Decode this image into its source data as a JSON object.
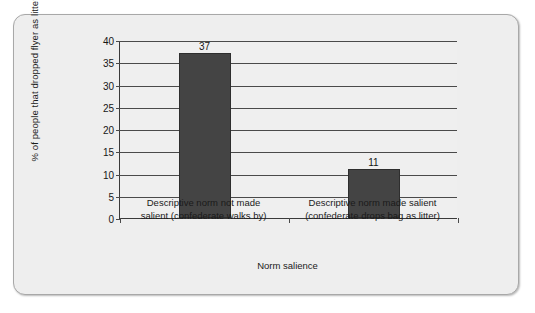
{
  "chart_data": {
    "type": "bar",
    "title": "",
    "categories": [
      "Descriptive norm not made\nsalient (confederate walks by)",
      "Descriptive norm made salient\n(confederate drops bag as litter)"
    ],
    "values": [
      37,
      11
    ],
    "value_labels": [
      "37",
      "11"
    ],
    "xlabel": "Norm salience",
    "ylabel": "% of people that dropped flyer as litter",
    "ylim": [
      0,
      40
    ],
    "ytick_labels": [
      "0",
      "5",
      "10",
      "15",
      "20",
      "25",
      "30",
      "35",
      "40"
    ],
    "ytick_values": [
      0,
      5,
      10,
      15,
      20,
      25,
      30,
      35,
      40
    ],
    "grid": true,
    "legend": "none",
    "colors": {
      "bar_fill": "#444444",
      "bar_border": "#2e2e2e",
      "plot_background": "#efefef",
      "panel_background": "#eeeeee",
      "panel_border": "#a8a8a8",
      "axis_line": "#3a3a3a",
      "gridline": "#4a4a4a",
      "text": "#1a1a1a"
    }
  }
}
